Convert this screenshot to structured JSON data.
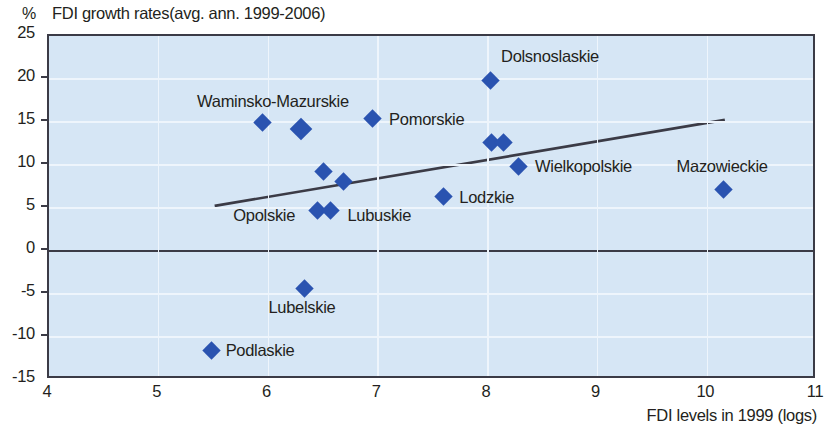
{
  "chart_data": {
    "type": "scatter",
    "title": "FDI growth rates(avg. ann. 1999-2006)",
    "ylabel": "%",
    "xlabel": "FDI levels in 1999 (logs)",
    "xlim": [
      4,
      11
    ],
    "ylim": [
      -15,
      25
    ],
    "grid": true,
    "legend": "none",
    "xticks": [
      "4",
      "5",
      "6",
      "7",
      "8",
      "9",
      "10",
      "11"
    ],
    "yticks": [
      "25",
      "20",
      "15",
      "10",
      "5",
      "0",
      "-5",
      "-10",
      "-15"
    ],
    "points": [
      {
        "label": "Waminsko-Mazurskie",
        "x": 5.95,
        "y": 14.9,
        "label_x": 5.35,
        "label_y": 17.2,
        "big": false
      },
      {
        "label": "",
        "x": 6.3,
        "y": 14.2,
        "label_x": 0,
        "label_y": 0,
        "big": true
      },
      {
        "label": "Pomorskie",
        "x": 6.95,
        "y": 15.4,
        "label_x": 7.1,
        "label_y": 15.1,
        "big": false
      },
      {
        "label": "Dolsnoslaskie",
        "x": 8.02,
        "y": 19.8,
        "label_x": 8.12,
        "label_y": 22.4,
        "big": false
      },
      {
        "label": "",
        "x": 6.5,
        "y": 9.3,
        "label_x": 0,
        "label_y": 0,
        "big": false
      },
      {
        "label": "",
        "x": 6.68,
        "y": 8.1,
        "label_x": 0,
        "label_y": 0,
        "big": false
      },
      {
        "label": "Opolskie",
        "x": 6.45,
        "y": 4.7,
        "label_x": 5.68,
        "label_y": 3.9,
        "big": false
      },
      {
        "label": "Lubuskie",
        "x": 6.57,
        "y": 4.7,
        "label_x": 6.72,
        "label_y": 3.9,
        "big": false
      },
      {
        "label": "Lodzkie",
        "x": 7.6,
        "y": 6.3,
        "label_x": 7.74,
        "label_y": 6.0,
        "big": false
      },
      {
        "label": "",
        "x": 8.03,
        "y": 12.6,
        "label_x": 0,
        "label_y": 0,
        "big": false
      },
      {
        "label": "",
        "x": 8.14,
        "y": 12.6,
        "label_x": 0,
        "label_y": 0,
        "big": false
      },
      {
        "label": "Wielkopolskie",
        "x": 8.28,
        "y": 9.8,
        "label_x": 8.43,
        "label_y": 9.6,
        "big": false
      },
      {
        "label": "Mazowieckie",
        "x": 10.15,
        "y": 7.1,
        "label_x": 9.72,
        "label_y": 9.6,
        "big": false
      },
      {
        "label": "Lubelskie",
        "x": 6.33,
        "y": -4.4,
        "label_x": 6.0,
        "label_y": -6.7,
        "big": false
      },
      {
        "label": "Podlaskie",
        "x": 5.48,
        "y": -11.6,
        "label_x": 5.61,
        "label_y": -11.8,
        "big": false
      }
    ],
    "trendline": {
      "x0": 5.51,
      "y0": 5.25,
      "x1": 10.16,
      "y1": 15.25,
      "color": "#3b3b46"
    },
    "colors": {
      "marker": "#2a53b0",
      "plot_background": "#d6e6f5",
      "gridline": "#eef5fc",
      "axis": "#3b3b46"
    }
  }
}
